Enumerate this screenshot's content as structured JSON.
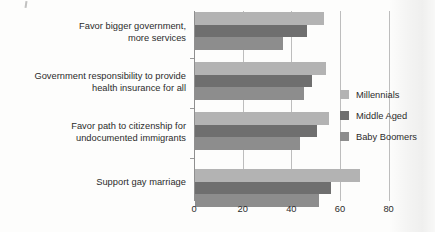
{
  "chart_data": {
    "type": "bar",
    "orientation": "horizontal",
    "title": "",
    "subtitle": "",
    "xlabel": "",
    "ylabel": "",
    "xlim": [
      0,
      80
    ],
    "xticks": [
      0,
      20,
      40,
      60,
      80
    ],
    "xtick_labels": [
      "0",
      "20",
      "40",
      "60",
      "80"
    ],
    "grid": "vertical",
    "legend_position": "right",
    "categories": [
      "Favor bigger government, more services",
      "Government responsibility to provide health insurance for all",
      "Favor path to citizenship for undocumented immigrants",
      "Support gay marriage"
    ],
    "series": [
      {
        "name": "Millennials",
        "color": "#b3b3b3",
        "values": [
          53,
          54,
          55,
          68
        ]
      },
      {
        "name": "Middle Aged",
        "color": "#6f6f6f",
        "values": [
          46,
          48,
          50,
          56
        ]
      },
      {
        "name": "Baby Boomers",
        "color": "#8d8d8d",
        "values": [
          36,
          45,
          43,
          51
        ]
      }
    ]
  },
  "axis": {
    "tick_labels": [
      "0",
      "20",
      "40",
      "60",
      "80"
    ]
  },
  "categories": [
    {
      "line1": "Favor bigger government,",
      "line2": "more services"
    },
    {
      "line1": "Government responsibility to provide",
      "line2": "health insurance for all"
    },
    {
      "line1": "Favor path to citizenship for",
      "line2": "undocumented immigrants"
    },
    {
      "line1": "Support gay marriage",
      "line2": ""
    }
  ],
  "legend": {
    "items": [
      {
        "label": "Millennials",
        "color": "#b3b3b3"
      },
      {
        "label": "Middle Aged",
        "color": "#6f6f6f"
      },
      {
        "label": "Baby Boomers",
        "color": "#8d8d8d"
      }
    ]
  }
}
